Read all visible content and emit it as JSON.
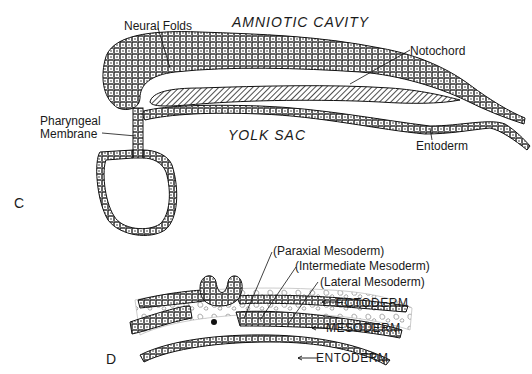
{
  "panel_c": {
    "panel_label": "C",
    "regions": {
      "amniotic_cavity": "AMNIOTIC CAVITY",
      "yolk_sac": "YOLK SAC"
    },
    "labels": {
      "neural_folds": "Neural Folds",
      "notochord": "Notochord",
      "pharyngeal_line1": "Pharyngeal",
      "pharyngeal_line2": "Membrane",
      "entoderm": "Entoderm"
    }
  },
  "panel_d": {
    "panel_label": "D",
    "labels": {
      "paraxial": "(Paraxial Mesoderm)",
      "intermediate": "(Intermediate Mesoderm)",
      "lateral": "(Lateral Mesoderm)",
      "ectoderm": "ECTODERM",
      "mesoderm": "MESODERM",
      "entoderm": "ENTODERM"
    }
  },
  "colors": {
    "line": "#1a1a1a",
    "background": "#ffffff"
  }
}
